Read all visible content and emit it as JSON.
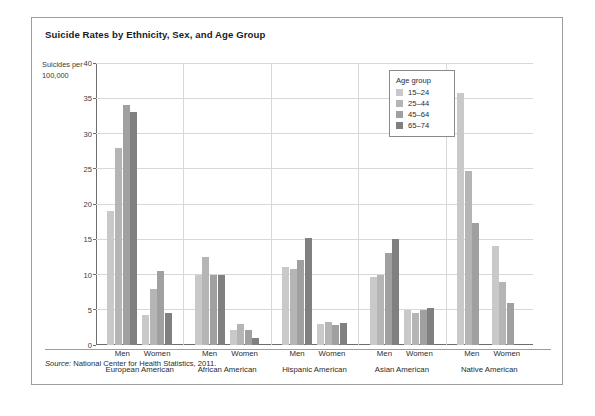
{
  "figure": {
    "title": "Suicide Rates by Ethnicity, Sex, and Age Group",
    "y_axis_caption": "Suicides per 100,000",
    "source_prefix": "Source:",
    "source_text": "National Center for Health Statistics, 2011."
  },
  "legend": {
    "title": "Age group",
    "entries": [
      {
        "label": "15–24",
        "color": "#c9c9c9"
      },
      {
        "label": "25–44",
        "color": "#b5b5b5"
      },
      {
        "label": "45–64",
        "color": "#a0a0a0"
      },
      {
        "label": "65–74",
        "color": "#808080"
      }
    ]
  },
  "chart_data": {
    "type": "bar",
    "title": "Suicide Rates by Ethnicity, Sex, and Age Group",
    "xlabel": "",
    "ylabel": "Suicides per 100,000",
    "ylim": [
      0,
      40
    ],
    "ytick_step": 5,
    "yticks": [
      "0",
      "5",
      "10",
      "15",
      "20",
      "25",
      "30",
      "35",
      "40"
    ],
    "grid": "horizontal",
    "legend_position": "inside-top-right",
    "series": [
      {
        "name": "15–24",
        "color": "#c9c9c9"
      },
      {
        "name": "25–44",
        "color": "#b5b5b5"
      },
      {
        "name": "45–64",
        "color": "#a0a0a0"
      },
      {
        "name": "65–74",
        "color": "#808080"
      }
    ],
    "ethnicities": [
      "European American",
      "African American",
      "Hispanic American",
      "Asian American",
      "Native American"
    ],
    "sexes": [
      "Men",
      "Women"
    ],
    "groups": [
      {
        "ethnicity": "European American",
        "sex": "Men",
        "values": [
          19.0,
          28.0,
          34.0,
          33.0
        ]
      },
      {
        "ethnicity": "European American",
        "sex": "Women",
        "values": [
          4.3,
          8.0,
          10.5,
          4.5
        ]
      },
      {
        "ethnicity": "African American",
        "sex": "Men",
        "values": [
          10.0,
          12.5,
          10.0,
          10.0
        ]
      },
      {
        "ethnicity": "African American",
        "sex": "Women",
        "values": [
          2.2,
          3.0,
          2.2,
          1.0
        ]
      },
      {
        "ethnicity": "Hispanic American",
        "sex": "Men",
        "values": [
          11.0,
          10.8,
          12.0,
          15.2
        ]
      },
      {
        "ethnicity": "Hispanic American",
        "sex": "Women",
        "values": [
          3.0,
          3.2,
          2.8,
          3.1
        ]
      },
      {
        "ethnicity": "Asian American",
        "sex": "Men",
        "values": [
          9.6,
          10.0,
          13.0,
          15.0
        ]
      },
      {
        "ethnicity": "Asian American",
        "sex": "Women",
        "values": [
          5.0,
          4.5,
          5.0,
          5.2
        ]
      },
      {
        "ethnicity": "Native American",
        "sex": "Men",
        "values": [
          35.7,
          24.7,
          17.3,
          0
        ]
      },
      {
        "ethnicity": "Native American",
        "sex": "Women",
        "values": [
          14.0,
          9.0,
          6.0,
          0
        ]
      }
    ]
  }
}
